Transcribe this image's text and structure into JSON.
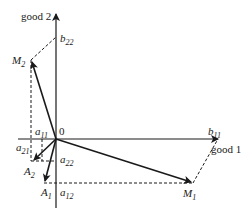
{
  "diagram": {
    "axes": {
      "x_label": "good 1",
      "y_label": "good 2",
      "origin_label": "0"
    },
    "points": {
      "M1": {
        "base": "M",
        "sub": "1"
      },
      "M2": {
        "base": "M",
        "sub": "2"
      },
      "A1": {
        "base": "A",
        "sub": "1"
      },
      "A2": {
        "base": "A",
        "sub": "2"
      },
      "b11": {
        "base": "b",
        "sub": "11"
      },
      "b22": {
        "base": "b",
        "sub": "22"
      },
      "a11": {
        "base": "a",
        "sub": "11"
      },
      "a12": {
        "base": "a",
        "sub": "12"
      },
      "a21": {
        "base": "a",
        "sub": "21"
      },
      "a22": {
        "base": "a",
        "sub": "22"
      }
    },
    "colors": {
      "ink": "#1a1a1a",
      "background": "#ffffff"
    }
  }
}
